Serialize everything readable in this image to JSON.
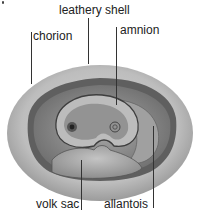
{
  "diagram": {
    "labels": {
      "leathery_shell": "leathery shell",
      "chorion": "chorion",
      "amnion": "amnion",
      "yolk_sac": "volk sac",
      "allantois": "allantois"
    },
    "colors": {
      "shell": "#bdbdbd",
      "chorion_lining": "#6e6e6e",
      "interior": "#9a9a9a",
      "amnion": "#b8b8b8",
      "embryo": "#8a8a8a",
      "yolk": "#a8a8a8",
      "text": "#222222",
      "leader": "#333333"
    }
  }
}
